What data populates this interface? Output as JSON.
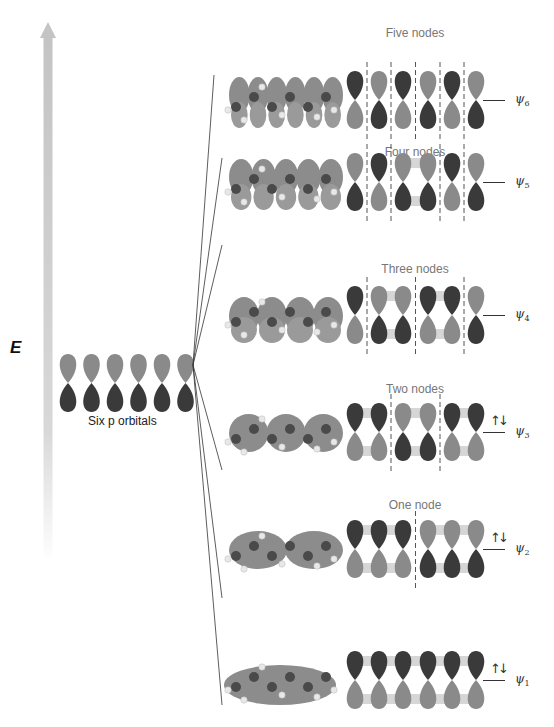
{
  "axis": {
    "label": "E",
    "direction": "increasing upward"
  },
  "atomic_orbitals": {
    "label": "Six p orbitals",
    "count": 6
  },
  "colors": {
    "dark_lobe": "#3a3a3a",
    "light_lobe": "#8a8a8a",
    "molecule_orbital": "#8c8c8c",
    "arrow": "#c8c8c8"
  },
  "molecular_orbitals": [
    {
      "name": "ψ6",
      "symbol": "ψ",
      "index": "6",
      "nodes_label": "Five nodes",
      "nodes": 5,
      "phases": [
        "D",
        "L",
        "D",
        "L",
        "D",
        "L"
      ],
      "node_positions": [
        1,
        2,
        3,
        4,
        5
      ],
      "electrons": ""
    },
    {
      "name": "ψ5",
      "symbol": "ψ",
      "index": "5",
      "nodes_label": "Four nodes",
      "nodes": 4,
      "phases": [
        "L",
        "D",
        "L",
        "L",
        "D",
        "L"
      ],
      "node_positions": [
        1,
        2,
        4,
        5
      ],
      "electrons": ""
    },
    {
      "name": "ψ4",
      "symbol": "ψ",
      "index": "4",
      "nodes_label": "Three nodes",
      "nodes": 3,
      "phases": [
        "D",
        "L",
        "L",
        "D",
        "D",
        "L"
      ],
      "node_positions": [
        1,
        3,
        5
      ],
      "electrons": ""
    },
    {
      "name": "ψ3",
      "symbol": "ψ",
      "index": "3",
      "nodes_label": "Two nodes",
      "nodes": 2,
      "phases": [
        "D",
        "D",
        "L",
        "L",
        "D",
        "D"
      ],
      "node_positions": [
        2,
        4
      ],
      "electrons": "↑↓"
    },
    {
      "name": "ψ2",
      "symbol": "ψ",
      "index": "2",
      "nodes_label": "One node",
      "nodes": 1,
      "phases": [
        "D",
        "D",
        "D",
        "L",
        "L",
        "L"
      ],
      "node_positions": [
        3
      ],
      "electrons": "↑↓"
    },
    {
      "name": "ψ1",
      "symbol": "ψ",
      "index": "1",
      "nodes_label": "",
      "nodes": 0,
      "phases": [
        "D",
        "D",
        "D",
        "D",
        "D",
        "D"
      ],
      "node_positions": [],
      "electrons": "↑↓"
    }
  ]
}
